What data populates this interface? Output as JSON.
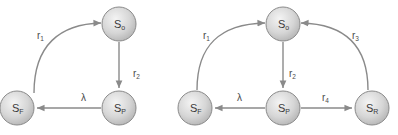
{
  "diagrams": [
    {
      "name": "three-state-model",
      "nodes": [
        {
          "id": "So",
          "base": "S",
          "sub": "o",
          "cx": 119,
          "cy": 24
        },
        {
          "id": "SP",
          "base": "S",
          "sub": "P",
          "cx": 119,
          "cy": 108
        },
        {
          "id": "SF",
          "base": "S",
          "sub": "F",
          "cx": 17,
          "cy": 108
        }
      ],
      "edges": [
        {
          "from": "SF",
          "to": "So",
          "label": {
            "base": "r",
            "sub": "1"
          }
        },
        {
          "from": "So",
          "to": "SP",
          "label": {
            "base": "r",
            "sub": "2"
          }
        },
        {
          "from": "SP",
          "to": "SF",
          "label": {
            "base": "λ",
            "sub": ""
          }
        }
      ]
    },
    {
      "name": "four-state-model",
      "nodes": [
        {
          "id": "So",
          "base": "S",
          "sub": "o",
          "cx": 283,
          "cy": 24
        },
        {
          "id": "SF",
          "base": "S",
          "sub": "F",
          "cx": 195,
          "cy": 108
        },
        {
          "id": "SP",
          "base": "S",
          "sub": "P",
          "cx": 283,
          "cy": 108
        },
        {
          "id": "SR",
          "base": "S",
          "sub": "R",
          "cx": 372,
          "cy": 108
        }
      ],
      "edges": [
        {
          "from": "SF",
          "to": "So",
          "label": {
            "base": "r",
            "sub": "1"
          }
        },
        {
          "from": "So",
          "to": "SP",
          "label": {
            "base": "r",
            "sub": "2"
          }
        },
        {
          "from": "SR",
          "to": "So",
          "label": {
            "base": "r",
            "sub": "3"
          }
        },
        {
          "from": "SP",
          "to": "SR",
          "label": {
            "base": "r",
            "sub": "4"
          }
        },
        {
          "from": "SP",
          "to": "SF",
          "label": {
            "base": "λ",
            "sub": ""
          }
        }
      ]
    }
  ],
  "labels": {
    "left_r1": "r",
    "left_r1_sub": "1",
    "left_r2": "r",
    "left_r2_sub": "2",
    "left_lambda": "λ",
    "right_r1": "r",
    "right_r1_sub": "1",
    "right_r2": "r",
    "right_r2_sub": "2",
    "right_r3": "r",
    "right_r3_sub": "3",
    "right_r4": "r",
    "right_r4_sub": "4",
    "right_lambda": "λ",
    "left_So": "S",
    "left_So_sub": "o",
    "left_SP": "S",
    "left_SP_sub": "P",
    "left_SF": "S",
    "left_SF_sub": "F",
    "right_So": "S",
    "right_So_sub": "o",
    "right_SF": "S",
    "right_SF_sub": "F",
    "right_SP": "S",
    "right_SP_sub": "P",
    "right_SR": "S",
    "right_SR_sub": "R"
  },
  "colors": {
    "node_fill_light": "#f0f0f0",
    "node_fill_dark": "#b8b8b8",
    "node_stroke": "#8a8a8a",
    "edge": "#8a8a8a",
    "text": "#3a3a3a"
  }
}
